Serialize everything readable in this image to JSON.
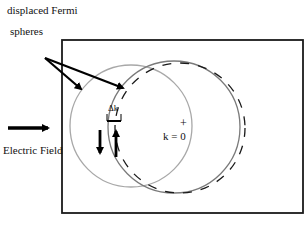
{
  "labels": {
    "caption_line1": "displaced Fermi",
    "caption_line2": "spheres",
    "electric_field": "Electric Field",
    "delta_k": "Δk",
    "origin_plus": "+",
    "origin": "k = 0"
  },
  "colors": {
    "frame": "#1a1a1a",
    "sphere_left": "#a8a8a8",
    "sphere_right": "#7a7a7a",
    "sphere_dashed": "#1a1a1a",
    "arrows": "#000000"
  }
}
